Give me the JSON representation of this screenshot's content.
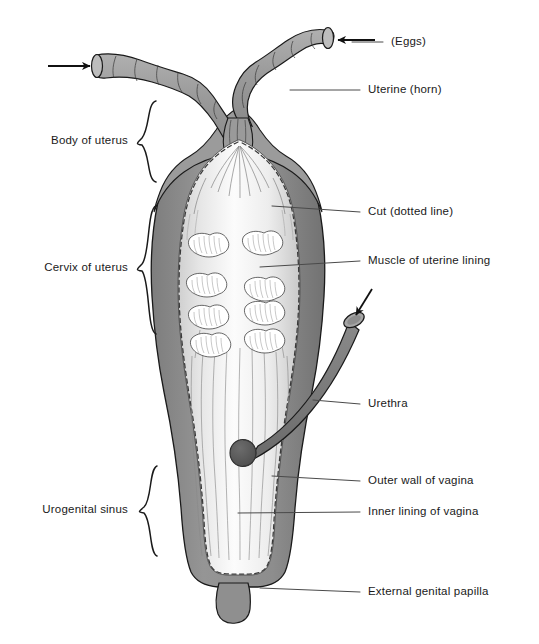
{
  "figure": {
    "background_color": "#ffffff",
    "ink_color": "#1a1a1a"
  },
  "palette": {
    "outer_wall_gray": "#8c8c8c",
    "outer_wall_dark": "#6e6e6e",
    "horn_gray": "#9a9a9a",
    "urethra_gray": "#787878",
    "lining_light": "#e9e9e9",
    "lining_highlight": "#fafafa",
    "muscle_white": "#ffffff",
    "outline": "#1a1a1a",
    "leader_line": "#555555",
    "hatch": "#8e8e8e"
  },
  "labels_right": [
    {
      "id": "eggs",
      "text": "(Eggs)",
      "x": 391,
      "y": 42,
      "leader": {
        "x1": 352,
        "y1": 42,
        "x2": 383,
        "y2": 42
      }
    },
    {
      "id": "uterine-horn",
      "text": "Uterine (horn)",
      "x": 368,
      "y": 90,
      "leader": {
        "x1": 290,
        "y1": 90,
        "x2": 360,
        "y2": 90
      }
    },
    {
      "id": "cut-dotted-line",
      "text": "Cut (dotted line)",
      "x": 368,
      "y": 212,
      "leader": {
        "x1": 272,
        "y1": 206,
        "x2": 360,
        "y2": 212
      }
    },
    {
      "id": "muscle-lining",
      "text": "Muscle of uterine lining",
      "x": 368,
      "y": 261,
      "leader": {
        "x1": 260,
        "y1": 267,
        "x2": 360,
        "y2": 261
      }
    },
    {
      "id": "urethra",
      "text": "Urethra",
      "x": 368,
      "y": 404,
      "leader": {
        "x1": 313,
        "y1": 400,
        "x2": 360,
        "y2": 404
      }
    },
    {
      "id": "outer-wall",
      "text": "Outer wall of vagina",
      "x": 368,
      "y": 481,
      "leader": {
        "x1": 272,
        "y1": 476,
        "x2": 360,
        "y2": 481
      }
    },
    {
      "id": "inner-lining",
      "text": "Inner lining of vagina",
      "x": 368,
      "y": 512,
      "leader": {
        "x1": 238,
        "y1": 513,
        "x2": 360,
        "y2": 512
      }
    },
    {
      "id": "papilla",
      "text": "External genital papilla",
      "x": 368,
      "y": 592,
      "leader": {
        "x1": 260,
        "y1": 588,
        "x2": 360,
        "y2": 592
      }
    }
  ],
  "labels_left": [
    {
      "id": "body-of-uterus",
      "text": "Body of uterus",
      "x": 128,
      "y": 141,
      "brace": {
        "x": 142,
        "y_top": 101,
        "y_bottom": 182
      }
    },
    {
      "id": "cervix-of-uterus",
      "text": "Cervix of uterus",
      "x": 128,
      "y": 268,
      "brace": {
        "x": 142,
        "y_top": 206,
        "y_bottom": 334
      }
    },
    {
      "id": "urogenital-sinus",
      "text": "Urogenital sinus",
      "x": 128,
      "y": 510,
      "brace": {
        "x": 142,
        "y_top": 466,
        "y_bottom": 556
      }
    }
  ],
  "anatomy": {
    "muscle_lobes": {
      "count": 8,
      "columns": 2,
      "rows": 4,
      "left_column_x": 196,
      "right_column_x": 249,
      "row_y": [
        246,
        284,
        308,
        336
      ],
      "row_y_right": [
        244,
        290,
        310,
        338
      ],
      "lobe_width": 38,
      "lobe_height": 20
    },
    "urethra": {
      "open_end_x": 356,
      "open_end_y": 316,
      "insertion_x": 243,
      "insertion_y": 453,
      "has_arrow": true
    },
    "horns": [
      {
        "side": "left",
        "tip_x": 96,
        "tip_y": 63,
        "has_arrow": true,
        "arrow_from_x": 48,
        "arrow_to_x": 88
      },
      {
        "side": "right",
        "tip_x": 327,
        "tip_y": 40,
        "has_arrow": true,
        "arrow_from_x": 375,
        "arrow_to_x": 336
      }
    ]
  }
}
